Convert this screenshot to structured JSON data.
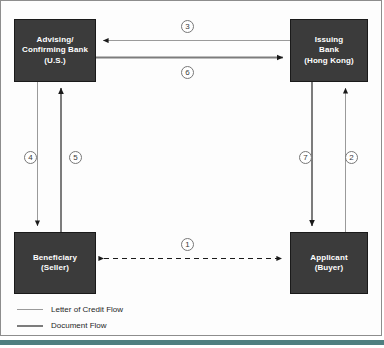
{
  "diagram": {
    "boxes": {
      "advising": {
        "line1": "Advising/",
        "line2": "Confirming Bank",
        "line3": "(U.S.)"
      },
      "issuing": {
        "line1": "Issuing",
        "line2": "Bank",
        "line3": "(Hong Kong)"
      },
      "beneficiary": {
        "line1": "Beneficiary",
        "line2": "(Seller)"
      },
      "applicant": {
        "line1": "Applicant",
        "line2": "(Buyer)"
      }
    },
    "step_numbers": {
      "s1": "1",
      "s2": "2",
      "s3": "3",
      "s4": "4",
      "s5": "5",
      "s6": "6",
      "s7": "7"
    },
    "legend": {
      "items": [
        {
          "label": "Letter of Credit Flow",
          "style": "thin-line"
        },
        {
          "label": "Document Flow",
          "style": "thick-line"
        }
      ]
    },
    "colors": {
      "box_fill": "#3b3b3b",
      "box_text": "#ffffff",
      "letter_of_credit_line": "#9a9a9a",
      "document_line": "#7c7c7c",
      "arrowhead": "#1a1a1a",
      "frame": "#8d8d8d",
      "footer_bar": "#4f7f80",
      "page_background": "#ffffff"
    }
  }
}
